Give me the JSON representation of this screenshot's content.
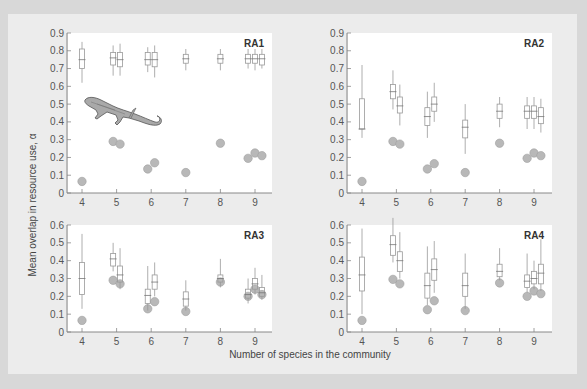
{
  "colors": {
    "outer_bg": "#d8d8d8",
    "panel_bg": "#ececec",
    "plot_bg": "#ffffff",
    "axis": "#888888",
    "box_stroke": "#999999",
    "dot_fill": "#b8b8b8",
    "dot_stroke": "#a0a0a0"
  },
  "labels": {
    "ylabel": "Mean overlap in resource use, α",
    "xlabel": "Number of species in the community"
  },
  "chart_data": [
    {
      "type": "box",
      "title": "RA1",
      "ylim": [
        0,
        0.9
      ],
      "yticks": [
        "0",
        "0.1",
        "0.2",
        "0.3",
        "0.4",
        "0.5",
        "0.6",
        "0.7",
        "0.8",
        "0.9"
      ],
      "xticks": [
        "4",
        "5",
        "6",
        "7",
        "8",
        "9"
      ],
      "boxes": [
        {
          "x": 4,
          "off": 0,
          "lo": 0.62,
          "q1": 0.7,
          "med": 0.75,
          "q3": 0.81,
          "hi": 0.85
        },
        {
          "x": 5,
          "off": -0.1,
          "lo": 0.66,
          "q1": 0.72,
          "med": 0.76,
          "q3": 0.79,
          "hi": 0.83
        },
        {
          "x": 5,
          "off": 0.1,
          "lo": 0.66,
          "q1": 0.71,
          "med": 0.75,
          "q3": 0.79,
          "hi": 0.84
        },
        {
          "x": 6,
          "off": -0.1,
          "lo": 0.68,
          "q1": 0.72,
          "med": 0.75,
          "q3": 0.79,
          "hi": 0.82
        },
        {
          "x": 6,
          "off": 0.1,
          "lo": 0.65,
          "q1": 0.71,
          "med": 0.75,
          "q3": 0.79,
          "hi": 0.83
        },
        {
          "x": 7,
          "off": 0,
          "lo": 0.69,
          "q1": 0.73,
          "med": 0.755,
          "q3": 0.78,
          "hi": 0.81
        },
        {
          "x": 8,
          "off": 0,
          "lo": 0.69,
          "q1": 0.73,
          "med": 0.755,
          "q3": 0.78,
          "hi": 0.81
        },
        {
          "x": 9,
          "off": -0.2,
          "lo": 0.7,
          "q1": 0.73,
          "med": 0.755,
          "q3": 0.78,
          "hi": 0.81
        },
        {
          "x": 9,
          "off": 0,
          "lo": 0.69,
          "q1": 0.73,
          "med": 0.755,
          "q3": 0.78,
          "hi": 0.81
        },
        {
          "x": 9,
          "off": 0.2,
          "lo": 0.7,
          "q1": 0.72,
          "med": 0.755,
          "q3": 0.78,
          "hi": 0.81
        }
      ],
      "observed": [
        {
          "x": 4,
          "off": 0,
          "y": 0.065
        },
        {
          "x": 5,
          "off": -0.1,
          "y": 0.29
        },
        {
          "x": 5,
          "off": 0.1,
          "y": 0.275
        },
        {
          "x": 6,
          "off": -0.1,
          "y": 0.135
        },
        {
          "x": 6,
          "off": 0.1,
          "y": 0.17
        },
        {
          "x": 7,
          "off": 0,
          "y": 0.115
        },
        {
          "x": 8,
          "off": 0,
          "y": 0.28
        },
        {
          "x": 9,
          "off": -0.2,
          "y": 0.195
        },
        {
          "x": 9,
          "off": 0,
          "y": 0.225
        },
        {
          "x": 9,
          "off": 0.2,
          "y": 0.21
        }
      ]
    },
    {
      "type": "box",
      "title": "RA2",
      "ylim": [
        0,
        0.9
      ],
      "yticks": [
        "0",
        "0.1",
        "0.2",
        "0.3",
        "0.4",
        "0.5",
        "0.6",
        "0.7",
        "0.8",
        "0.9"
      ],
      "xticks": [
        "4",
        "5",
        "6",
        "7",
        "8",
        "9"
      ],
      "boxes": [
        {
          "x": 4,
          "off": 0,
          "lo": 0.31,
          "q1": 0.36,
          "med": 0.36,
          "q3": 0.53,
          "hi": 0.72
        },
        {
          "x": 5,
          "off": -0.1,
          "lo": 0.47,
          "q1": 0.53,
          "med": 0.57,
          "q3": 0.61,
          "hi": 0.69
        },
        {
          "x": 5,
          "off": 0.1,
          "lo": 0.38,
          "q1": 0.45,
          "med": 0.49,
          "q3": 0.54,
          "hi": 0.61
        },
        {
          "x": 6,
          "off": -0.1,
          "lo": 0.31,
          "q1": 0.38,
          "med": 0.43,
          "q3": 0.48,
          "hi": 0.57
        },
        {
          "x": 6,
          "off": 0.1,
          "lo": 0.4,
          "q1": 0.46,
          "med": 0.5,
          "q3": 0.54,
          "hi": 0.62
        },
        {
          "x": 7,
          "off": 0,
          "lo": 0.22,
          "q1": 0.31,
          "med": 0.37,
          "q3": 0.41,
          "hi": 0.5
        },
        {
          "x": 8,
          "off": 0,
          "lo": 0.37,
          "q1": 0.42,
          "med": 0.46,
          "q3": 0.5,
          "hi": 0.54
        },
        {
          "x": 9,
          "off": -0.2,
          "lo": 0.36,
          "q1": 0.42,
          "med": 0.46,
          "q3": 0.49,
          "hi": 0.54
        },
        {
          "x": 9,
          "off": 0,
          "lo": 0.36,
          "q1": 0.42,
          "med": 0.46,
          "q3": 0.49,
          "hi": 0.54
        },
        {
          "x": 9,
          "off": 0.2,
          "lo": 0.34,
          "q1": 0.39,
          "med": 0.43,
          "q3": 0.48,
          "hi": 0.53
        }
      ],
      "observed": [
        {
          "x": 4,
          "off": 0,
          "y": 0.065
        },
        {
          "x": 5,
          "off": -0.1,
          "y": 0.29
        },
        {
          "x": 5,
          "off": 0.1,
          "y": 0.275
        },
        {
          "x": 6,
          "off": -0.1,
          "y": 0.135
        },
        {
          "x": 6,
          "off": 0.1,
          "y": 0.165
        },
        {
          "x": 7,
          "off": 0,
          "y": 0.115
        },
        {
          "x": 8,
          "off": 0,
          "y": 0.28
        },
        {
          "x": 9,
          "off": -0.2,
          "y": 0.195
        },
        {
          "x": 9,
          "off": 0,
          "y": 0.225
        },
        {
          "x": 9,
          "off": 0.2,
          "y": 0.21
        }
      ]
    },
    {
      "type": "box",
      "title": "RA3",
      "ylim": [
        0,
        0.6
      ],
      "yticks": [
        "0",
        "0.1",
        "0.2",
        "0.3",
        "0.4",
        "0.5",
        "0.6"
      ],
      "xticks": [
        "4",
        "5",
        "6",
        "7",
        "8",
        "9"
      ],
      "boxes": [
        {
          "x": 4,
          "off": 0,
          "lo": 0.13,
          "q1": 0.21,
          "med": 0.3,
          "q3": 0.39,
          "hi": 0.55
        },
        {
          "x": 5,
          "off": -0.1,
          "lo": 0.34,
          "q1": 0.37,
          "med": 0.41,
          "q3": 0.44,
          "hi": 0.5
        },
        {
          "x": 5,
          "off": 0.1,
          "lo": 0.24,
          "q1": 0.28,
          "med": 0.32,
          "q3": 0.37,
          "hi": 0.47
        },
        {
          "x": 6,
          "off": -0.1,
          "lo": 0.12,
          "q1": 0.16,
          "med": 0.205,
          "q3": 0.24,
          "hi": 0.37
        },
        {
          "x": 6,
          "off": 0.1,
          "lo": 0.2,
          "q1": 0.24,
          "med": 0.28,
          "q3": 0.32,
          "hi": 0.39
        },
        {
          "x": 7,
          "off": 0,
          "lo": 0.12,
          "q1": 0.145,
          "med": 0.185,
          "q3": 0.225,
          "hi": 0.29
        },
        {
          "x": 8,
          "off": 0,
          "lo": 0.25,
          "q1": 0.28,
          "med": 0.3,
          "q3": 0.32,
          "hi": 0.41
        },
        {
          "x": 9,
          "off": -0.2,
          "lo": 0.16,
          "q1": 0.19,
          "med": 0.21,
          "q3": 0.24,
          "hi": 0.3
        },
        {
          "x": 9,
          "off": 0,
          "lo": 0.21,
          "q1": 0.24,
          "med": 0.27,
          "q3": 0.3,
          "hi": 0.36
        },
        {
          "x": 9,
          "off": 0.2,
          "lo": 0.18,
          "q1": 0.2,
          "med": 0.22,
          "q3": 0.25,
          "hi": 0.32
        }
      ],
      "observed": [
        {
          "x": 4,
          "off": 0,
          "y": 0.065
        },
        {
          "x": 5,
          "off": -0.1,
          "y": 0.29
        },
        {
          "x": 5,
          "off": 0.1,
          "y": 0.27
        },
        {
          "x": 6,
          "off": -0.1,
          "y": 0.13
        },
        {
          "x": 6,
          "off": 0.1,
          "y": 0.17
        },
        {
          "x": 7,
          "off": 0,
          "y": 0.115
        },
        {
          "x": 8,
          "off": 0,
          "y": 0.28
        },
        {
          "x": 9,
          "off": -0.2,
          "y": 0.2
        },
        {
          "x": 9,
          "off": 0,
          "y": 0.24
        },
        {
          "x": 9,
          "off": 0.2,
          "y": 0.21
        }
      ]
    },
    {
      "type": "box",
      "title": "RA4",
      "ylim": [
        0,
        0.6
      ],
      "yticks": [
        "0",
        "0.1",
        "0.2",
        "0.3",
        "0.4",
        "0.5",
        "0.6"
      ],
      "xticks": [
        "4",
        "5",
        "6",
        "7",
        "8",
        "9"
      ],
      "boxes": [
        {
          "x": 4,
          "off": 0,
          "lo": 0.1,
          "q1": 0.23,
          "med": 0.32,
          "q3": 0.42,
          "hi": 0.58
        },
        {
          "x": 5,
          "off": -0.1,
          "lo": 0.39,
          "q1": 0.43,
          "med": 0.49,
          "q3": 0.54,
          "hi": 0.64
        },
        {
          "x": 5,
          "off": 0.1,
          "lo": 0.3,
          "q1": 0.34,
          "med": 0.4,
          "q3": 0.45,
          "hi": 0.56
        },
        {
          "x": 6,
          "off": -0.1,
          "lo": 0.15,
          "q1": 0.19,
          "med": 0.26,
          "q3": 0.33,
          "hi": 0.48
        },
        {
          "x": 6,
          "off": 0.1,
          "lo": 0.22,
          "q1": 0.29,
          "med": 0.35,
          "q3": 0.41,
          "hi": 0.51
        },
        {
          "x": 7,
          "off": 0,
          "lo": 0.13,
          "q1": 0.2,
          "med": 0.26,
          "q3": 0.33,
          "hi": 0.44
        },
        {
          "x": 8,
          "off": 0,
          "lo": 0.29,
          "q1": 0.31,
          "med": 0.34,
          "q3": 0.38,
          "hi": 0.47
        },
        {
          "x": 9,
          "off": -0.2,
          "lo": 0.22,
          "q1": 0.25,
          "med": 0.285,
          "q3": 0.32,
          "hi": 0.44
        },
        {
          "x": 9,
          "off": 0,
          "lo": 0.24,
          "q1": 0.27,
          "med": 0.3,
          "q3": 0.34,
          "hi": 0.4
        },
        {
          "x": 9,
          "off": 0.2,
          "lo": 0.23,
          "q1": 0.27,
          "med": 0.33,
          "q3": 0.38,
          "hi": 0.52
        }
      ],
      "observed": [
        {
          "x": 4,
          "off": 0,
          "y": 0.065
        },
        {
          "x": 5,
          "off": -0.1,
          "y": 0.295
        },
        {
          "x": 5,
          "off": 0.1,
          "y": 0.27
        },
        {
          "x": 6,
          "off": -0.1,
          "y": 0.125
        },
        {
          "x": 6,
          "off": 0.1,
          "y": 0.175
        },
        {
          "x": 7,
          "off": 0,
          "y": 0.12
        },
        {
          "x": 8,
          "off": 0,
          "y": 0.275
        },
        {
          "x": 9,
          "off": -0.2,
          "y": 0.2
        },
        {
          "x": 9,
          "off": 0,
          "y": 0.23
        },
        {
          "x": 9,
          "off": 0.2,
          "y": 0.215
        }
      ]
    }
  ]
}
